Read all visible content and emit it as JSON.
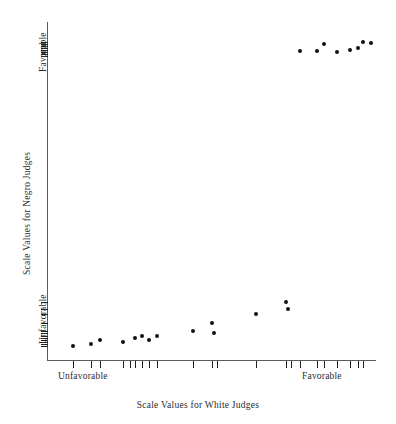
{
  "figure": {
    "width": 396,
    "height": 424,
    "background": "#ffffff",
    "ink_color": "#111111",
    "axis_color": "#5c5c5c",
    "top_caption": "",
    "plot": {
      "left": 48,
      "top": 22,
      "width": 327,
      "height": 338,
      "x_axis_y": 360,
      "y_axis_x": 47
    }
  },
  "chart_data": {
    "type": "scatter",
    "title": "",
    "subtitle": "",
    "xlabel": "Scale Values for White Judges",
    "ylabel": "Scale Values for Negro Judges",
    "x_tick_labels": [
      "Unfavorable",
      "Favorable"
    ],
    "y_tick_labels": [
      "Favorable",
      "Unfavorable"
    ],
    "x_tick_label_positions": [
      0.07,
      0.8
    ],
    "y_tick_label_positions": [
      0.93,
      0.12
    ],
    "xlim": [
      0,
      1
    ],
    "ylim": [
      0,
      1
    ],
    "grid": false,
    "legend": null,
    "legend_position": "none",
    "annotations": [],
    "point_radius_px": 2,
    "n_points": 22,
    "points": [
      {
        "x": 0.076,
        "y": 0.04
      },
      {
        "x": 0.133,
        "y": 0.047
      },
      {
        "x": 0.16,
        "y": 0.059
      },
      {
        "x": 0.23,
        "y": 0.053
      },
      {
        "x": 0.266,
        "y": 0.065
      },
      {
        "x": 0.288,
        "y": 0.071
      },
      {
        "x": 0.31,
        "y": 0.059
      },
      {
        "x": 0.334,
        "y": 0.071
      },
      {
        "x": 0.443,
        "y": 0.086
      },
      {
        "x": 0.503,
        "y": 0.109
      },
      {
        "x": 0.509,
        "y": 0.08
      },
      {
        "x": 0.636,
        "y": 0.136
      },
      {
        "x": 0.727,
        "y": 0.172
      },
      {
        "x": 0.733,
        "y": 0.151
      },
      {
        "x": 0.77,
        "y": 0.915
      },
      {
        "x": 0.824,
        "y": 0.915
      },
      {
        "x": 0.845,
        "y": 0.936
      },
      {
        "x": 0.885,
        "y": 0.912
      },
      {
        "x": 0.924,
        "y": 0.918
      },
      {
        "x": 0.948,
        "y": 0.924
      },
      {
        "x": 0.964,
        "y": 0.941
      },
      {
        "x": 0.988,
        "y": 0.938
      }
    ],
    "x_rug_ticks": [
      0.076,
      0.133,
      0.16,
      0.23,
      0.252,
      0.266,
      0.288,
      0.31,
      0.334,
      0.443,
      0.503,
      0.518,
      0.636,
      0.727,
      0.742,
      0.77,
      0.824,
      0.845,
      0.885,
      0.924,
      0.948,
      0.964
    ],
    "y_rug_ticks": [
      0.041,
      0.047,
      0.053,
      0.059,
      0.065,
      0.071,
      0.08,
      0.086,
      0.109,
      0.136,
      0.151,
      0.172,
      0.9,
      0.906,
      0.912,
      0.918,
      0.924,
      0.93,
      0.936,
      0.941
    ]
  },
  "labels": {
    "x_axis_title": "Scale Values for White Judges",
    "y_axis_title": "Scale Values for Negro Judges",
    "x_left_category": "Unfavorable",
    "x_right_category": "Favorable",
    "y_top_category": "Favorable",
    "y_bottom_category": "Unfavorable"
  }
}
